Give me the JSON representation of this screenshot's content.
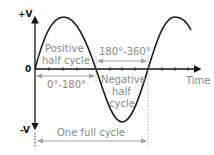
{
  "axes": {
    "y_top_label": "+V",
    "y_bottom_label": "-V",
    "origin_label": "0",
    "x_label": "Time"
  },
  "annotations": {
    "positive_line1": "Positive",
    "positive_line2": "half cycle",
    "negative_line1": "Negative",
    "negative_line2": "half",
    "negative_line3": "cycle",
    "range_first": "0°-180°",
    "range_second": "180°-360°",
    "full_cycle": "One full cycle"
  },
  "colors": {
    "curve": "#1a1a1a",
    "axis": "#111111",
    "annotation_text": "#888888",
    "annotation_arrow": "#a0a0a0"
  }
}
